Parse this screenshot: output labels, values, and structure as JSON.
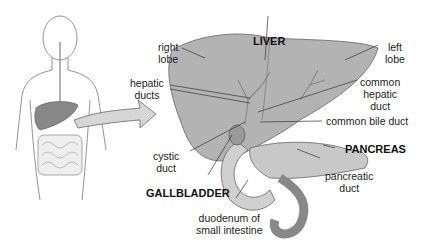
{
  "labels": {
    "liver": "LIVER",
    "right_lobe_1": "right",
    "right_lobe_2": "lobe",
    "left_lobe_1": "left",
    "left_lobe_2": "lobe",
    "hepatic_ducts_1": "hepatic",
    "hepatic_ducts_2": "ducts",
    "common_hepatic_1": "common",
    "common_hepatic_2": "hepatic",
    "common_hepatic_3": "duct",
    "common_bile_duct": "common bile duct",
    "pancreas": "PANCREAS",
    "pancreatic_duct_1": "pancreatic",
    "pancreatic_duct_2": "duct",
    "cystic_duct_1": "cystic",
    "cystic_duct_2": "duct",
    "gallbladder": "GALLBLADDER",
    "duodenum_1": "duodenum of",
    "duodenum_2": "small intestine"
  },
  "colors": {
    "organ": "#a9a9a9",
    "organ_light": "#cfcfcf",
    "line": "#333333",
    "arrow": "#d6d6d6"
  }
}
